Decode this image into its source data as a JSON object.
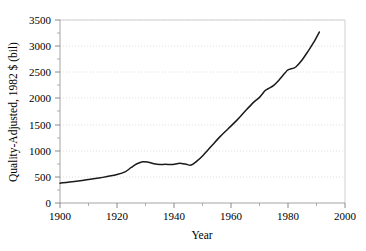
{
  "chart_data": {
    "type": "line",
    "title": "",
    "xlabel": "Year",
    "ylabel": "Quality-Adjusted, 1982 $ (bil)",
    "xlim": [
      1900,
      2000
    ],
    "ylim": [
      0,
      3500
    ],
    "xticks": [
      1900,
      1920,
      1940,
      1960,
      1980,
      2000
    ],
    "xtick_labels": [
      "1900",
      "1920",
      "1940",
      "1960",
      "1980",
      "2000"
    ],
    "xtick_minor_step": 10,
    "yticks": [
      0,
      500,
      1000,
      1500,
      2000,
      2500,
      3000,
      3500
    ],
    "ytick_labels": [
      "0",
      "500",
      "1000",
      "1500",
      "2000",
      "2500",
      "3000",
      "3500"
    ],
    "grid": "horizontal-dotted",
    "legend": "none",
    "series": [
      {
        "name": "Quality-Adjusted Capital Stock",
        "color": "#1a1a1a",
        "x": [
          1900,
          1905,
          1910,
          1915,
          1920,
          1923,
          1925,
          1927,
          1929,
          1931,
          1933,
          1935,
          1937,
          1939,
          1941,
          1942,
          1944,
          1946,
          1948,
          1950,
          1953,
          1956,
          1959,
          1962,
          1965,
          1968,
          1970,
          1972,
          1973,
          1975,
          1977,
          1979,
          1980,
          1982,
          1983,
          1985,
          1987,
          1989,
          1991
        ],
        "y": [
          380,
          410,
          450,
          490,
          545,
          600,
          680,
          750,
          790,
          780,
          750,
          735,
          740,
          735,
          750,
          760,
          745,
          725,
          800,
          900,
          1080,
          1260,
          1420,
          1580,
          1760,
          1930,
          2020,
          2150,
          2185,
          2250,
          2360,
          2490,
          2545,
          2580,
          2615,
          2740,
          2900,
          3070,
          3270
        ]
      }
    ]
  },
  "axis_label_unicode": {
    "dollar": "$"
  }
}
